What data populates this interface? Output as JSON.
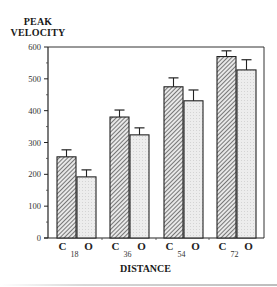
{
  "chart_data": {
    "type": "bar",
    "title": "",
    "ylabel": "PEAK VELOCITY",
    "ylabel_lines": [
      "PEAK",
      "VELOCITY"
    ],
    "xlabel": "DISTANCE",
    "ylim": [
      0,
      600
    ],
    "yticks": [
      0,
      100,
      200,
      300,
      400,
      500,
      600
    ],
    "grid": false,
    "legend": null,
    "categories": [
      "18",
      "36",
      "54",
      "72"
    ],
    "bar_labels": [
      "C",
      "O"
    ],
    "series": [
      {
        "name": "C",
        "pattern": "hatched",
        "values": [
          255,
          380,
          475,
          570
        ],
        "error": [
          22,
          22,
          28,
          18
        ]
      },
      {
        "name": "O",
        "pattern": "light-stipple",
        "values": [
          192,
          324,
          431,
          528
        ],
        "error": [
          22,
          22,
          34,
          32
        ]
      }
    ]
  },
  "axis": {
    "ylabel_line1": "PEAK",
    "ylabel_line2": "VELOCITY",
    "xlabel": "DISTANCE"
  }
}
